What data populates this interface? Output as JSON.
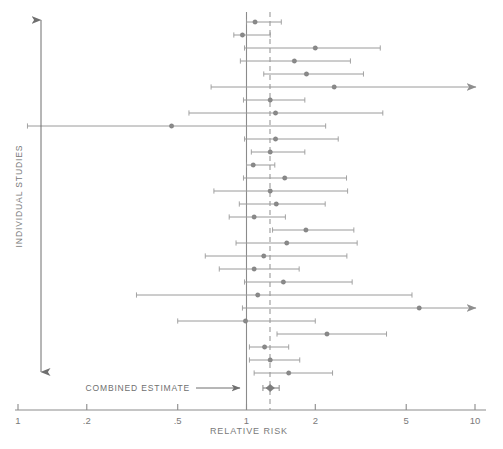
{
  "figure": {
    "type": "forest-plot",
    "x_axis_title": "RELATIVE RISK",
    "y_axis_title": "INDIVIDUAL STUDIES",
    "combined_label": "COMBINED ESTIMATE"
  },
  "chart_data": {
    "type": "scatter",
    "title": "",
    "subtitle": "",
    "xlabel": "RELATIVE RISK",
    "ylabel": "INDIVIDUAL STUDIES",
    "xscale": "log",
    "xlim": [
      0.1,
      11.5
    ],
    "grid": false,
    "legend": "none",
    "tick_labels": [
      "1",
      ".2",
      ".5",
      "1",
      "2",
      "5",
      "10"
    ],
    "tick_values": [
      0.1,
      0.2,
      0.5,
      1,
      2,
      5,
      10
    ],
    "null_line": 1.0,
    "pooled_line": 1.27,
    "marker_color": "#8a8a8a",
    "line_color": "#9a9a9a",
    "axis_color": "#8a8a8a",
    "series": [
      {
        "name": "Individual studies",
        "point_label": "relative risk",
        "interval_label": "95% confidence interval",
        "values": [
          {
            "id": 1,
            "rr": 1.09,
            "lo": 1.0,
            "hi": 1.42,
            "truncated_high": false
          },
          {
            "id": 2,
            "rr": 0.96,
            "lo": 0.88,
            "hi": 1.27,
            "truncated_high": false
          },
          {
            "id": 3,
            "rr": 2.0,
            "lo": 0.98,
            "hi": 3.85,
            "truncated_high": false
          },
          {
            "id": 4,
            "rr": 1.62,
            "lo": 0.94,
            "hi": 2.85,
            "truncated_high": false
          },
          {
            "id": 5,
            "rr": 1.83,
            "lo": 1.19,
            "hi": 3.25,
            "truncated_high": false
          },
          {
            "id": 6,
            "rr": 2.42,
            "lo": 0.7,
            "hi": 11.5,
            "truncated_high": true
          },
          {
            "id": 7,
            "rr": 1.27,
            "lo": 0.97,
            "hi": 1.8,
            "truncated_high": false
          },
          {
            "id": 8,
            "rr": 1.34,
            "lo": 0.56,
            "hi": 3.95,
            "truncated_high": false
          },
          {
            "id": 9,
            "rr": 0.47,
            "lo": 0.11,
            "hi": 2.22,
            "truncated_high": false
          },
          {
            "id": 10,
            "rr": 1.34,
            "lo": 0.98,
            "hi": 2.52,
            "truncated_high": false
          },
          {
            "id": 11,
            "rr": 1.27,
            "lo": 1.05,
            "hi": 1.8,
            "truncated_high": false
          },
          {
            "id": 12,
            "rr": 1.07,
            "lo": 1.0,
            "hi": 1.33,
            "truncated_high": false
          },
          {
            "id": 13,
            "rr": 1.47,
            "lo": 0.97,
            "hi": 2.74,
            "truncated_high": false
          },
          {
            "id": 14,
            "rr": 1.27,
            "lo": 0.72,
            "hi": 2.77,
            "truncated_high": false
          },
          {
            "id": 15,
            "rr": 1.35,
            "lo": 0.93,
            "hi": 2.21,
            "truncated_high": false
          },
          {
            "id": 16,
            "rr": 1.08,
            "lo": 0.84,
            "hi": 1.48,
            "truncated_high": false
          },
          {
            "id": 17,
            "rr": 1.82,
            "lo": 1.3,
            "hi": 2.95,
            "truncated_high": false
          },
          {
            "id": 18,
            "rr": 1.5,
            "lo": 0.9,
            "hi": 3.05,
            "truncated_high": false
          },
          {
            "id": 19,
            "rr": 1.19,
            "lo": 0.66,
            "hi": 2.75,
            "truncated_high": false
          },
          {
            "id": 20,
            "rr": 1.08,
            "lo": 0.76,
            "hi": 1.7,
            "truncated_high": false
          },
          {
            "id": 21,
            "rr": 1.45,
            "lo": 0.98,
            "hi": 2.9,
            "truncated_high": false
          },
          {
            "id": 22,
            "rr": 1.12,
            "lo": 0.33,
            "hi": 5.3,
            "truncated_high": false
          },
          {
            "id": 23,
            "rr": 5.7,
            "lo": 0.96,
            "hi": 11.5,
            "truncated_high": true
          },
          {
            "id": 24,
            "rr": 0.99,
            "lo": 0.5,
            "hi": 2.0,
            "truncated_high": false
          },
          {
            "id": 25,
            "rr": 2.25,
            "lo": 1.36,
            "hi": 4.1,
            "truncated_high": false
          },
          {
            "id": 26,
            "rr": 1.2,
            "lo": 1.03,
            "hi": 1.53,
            "truncated_high": false
          },
          {
            "id": 27,
            "rr": 1.27,
            "lo": 1.03,
            "hi": 1.71,
            "truncated_high": false
          },
          {
            "id": 28,
            "rr": 1.53,
            "lo": 1.08,
            "hi": 2.38,
            "truncated_high": false
          }
        ]
      },
      {
        "name": "Combined estimate",
        "point_label": "pooled relative risk",
        "values": [
          {
            "id": "pooled",
            "rr": 1.27,
            "lo": 1.18,
            "hi": 1.39,
            "truncated_high": false
          }
        ]
      }
    ]
  },
  "geometry": {
    "comment": "pixel mapping used to draw the figure",
    "x_of_01": 15,
    "x_of_1": 246.5,
    "x_of_10": 472,
    "px_per_decade": 228.5,
    "axis_y": 410,
    "row_top": 22,
    "row_step": 13,
    "clip_right": 476
  }
}
